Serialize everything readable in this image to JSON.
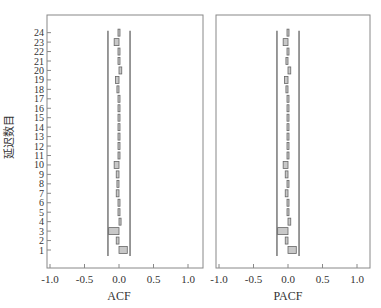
{
  "chart_data": [
    {
      "type": "bar",
      "orientation": "horizontal",
      "title": "",
      "xlabel": "ACF",
      "ylabel": "延迟数目",
      "xlim": [
        -1.0,
        1.15
      ],
      "x_ticks": [
        "-1.0",
        "-0.5",
        "0.0",
        "0.5",
        "1.0"
      ],
      "x_tick_values": [
        -1.0,
        -0.5,
        0.0,
        0.5,
        1.0
      ],
      "categories": [
        "1",
        "2",
        "3",
        "4",
        "5",
        "6",
        "7",
        "8",
        "9",
        "10",
        "11",
        "12",
        "13",
        "14",
        "15",
        "16",
        "17",
        "18",
        "19",
        "20",
        "21",
        "22",
        "23",
        "24"
      ],
      "values": [
        0.12,
        -0.04,
        -0.15,
        0.03,
        0.01,
        0.01,
        -0.04,
        -0.03,
        -0.04,
        -0.07,
        0.01,
        0.01,
        0.01,
        0.01,
        0.01,
        0.01,
        0.01,
        -0.03,
        -0.05,
        0.04,
        -0.02,
        0.01,
        -0.07,
        -0.02
      ],
      "confidence_limits": [
        -0.16,
        0.16
      ],
      "grid": false
    },
    {
      "type": "bar",
      "orientation": "horizontal",
      "title": "",
      "xlabel": "PACF",
      "ylabel": "",
      "xlim": [
        -1.0,
        1.15
      ],
      "x_ticks": [
        "-1.0",
        "-0.5",
        "0.0",
        "0.5",
        "1.0"
      ],
      "x_tick_values": [
        -1.0,
        -0.5,
        0.0,
        0.5,
        1.0
      ],
      "categories": [
        "1",
        "2",
        "3",
        "4",
        "5",
        "6",
        "7",
        "8",
        "9",
        "10",
        "11",
        "12",
        "13",
        "14",
        "15",
        "16",
        "17",
        "18",
        "19",
        "20",
        "21",
        "22",
        "23",
        "24"
      ],
      "values": [
        0.12,
        -0.04,
        -0.15,
        0.04,
        0.01,
        0.01,
        -0.04,
        -0.02,
        -0.04,
        -0.07,
        0.01,
        0.01,
        0.02,
        0.01,
        0.01,
        0.01,
        0.01,
        -0.03,
        -0.05,
        0.04,
        -0.03,
        0.01,
        -0.07,
        -0.02
      ],
      "confidence_limits": [
        -0.16,
        0.16
      ],
      "grid": false
    }
  ]
}
